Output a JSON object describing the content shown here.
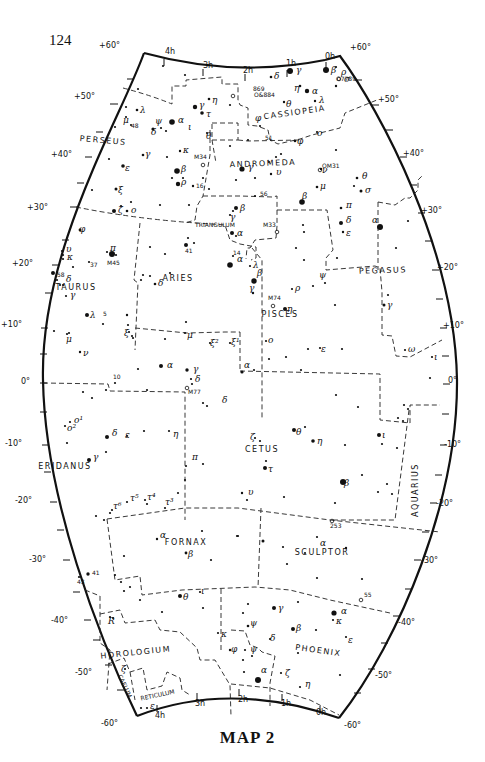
{
  "page": {
    "number": "124",
    "title": "MAP 2"
  },
  "map": {
    "border": {
      "top": "M 130 13 Q 240 50 362 55",
      "left_top_corner": [
        130,
        13
      ],
      "right_top_corner": [
        362,
        55
      ],
      "bottom_left_corner": [
        137,
        716
      ],
      "bottom_right_corner": [
        339,
        718
      ]
    },
    "declination_labels_left": [
      {
        "label": "+60°",
        "x": 120,
        "y": 48
      },
      {
        "label": "+50°",
        "x": 95,
        "y": 99
      },
      {
        "label": "+40°",
        "x": 72,
        "y": 157
      },
      {
        "label": "+30°",
        "x": 48,
        "y": 210
      },
      {
        "label": "+20°",
        "x": 33,
        "y": 266
      },
      {
        "label": "+10°",
        "x": 22,
        "y": 327
      },
      {
        "label": "0°",
        "x": 30,
        "y": 384
      },
      {
        "label": "-10°",
        "x": 22,
        "y": 446
      },
      {
        "label": "-20°",
        "x": 32,
        "y": 503
      },
      {
        "label": "-30°",
        "x": 46,
        "y": 562
      },
      {
        "label": "-40°",
        "x": 68,
        "y": 623
      },
      {
        "label": "-50°",
        "x": 92,
        "y": 675
      },
      {
        "label": "-60°",
        "x": 118,
        "y": 726
      }
    ],
    "declination_labels_right": [
      {
        "label": "+60°",
        "x": 350,
        "y": 50
      },
      {
        "label": "+50°",
        "x": 378,
        "y": 102
      },
      {
        "label": "+40°",
        "x": 403,
        "y": 156
      },
      {
        "label": "+30°",
        "x": 421,
        "y": 213
      },
      {
        "label": "+20°",
        "x": 437,
        "y": 270
      },
      {
        "label": "+10°",
        "x": 443,
        "y": 328
      },
      {
        "label": "0°",
        "x": 448,
        "y": 383
      },
      {
        "label": "-10°",
        "x": 444,
        "y": 447
      },
      {
        "label": "-20°",
        "x": 436,
        "y": 506
      },
      {
        "label": "-30°",
        "x": 421,
        "y": 563
      },
      {
        "label": "-40°",
        "x": 398,
        "y": 625
      },
      {
        "label": "-50°",
        "x": 375,
        "y": 678
      },
      {
        "label": "-60°",
        "x": 344,
        "y": 728
      }
    ],
    "ra_labels_top": [
      {
        "label": "4h",
        "x": 165,
        "y": 54
      },
      {
        "label": "3h",
        "x": 203,
        "y": 68
      },
      {
        "label": "2h",
        "x": 243,
        "y": 73
      },
      {
        "label": "1h",
        "x": 286,
        "y": 66
      },
      {
        "label": "0h",
        "x": 325,
        "y": 59
      }
    ],
    "ra_labels_bottom": [
      {
        "label": "4h",
        "x": 155,
        "y": 718
      },
      {
        "label": "3h",
        "x": 195,
        "y": 706
      },
      {
        "label": "2h",
        "x": 238,
        "y": 702
      },
      {
        "label": "1h",
        "x": 281,
        "y": 706
      },
      {
        "label": "0h",
        "x": 316,
        "y": 715
      }
    ],
    "constellations": [
      {
        "name": "CASSIOPEIA",
        "x": 295,
        "y": 115,
        "rotate": -8
      },
      {
        "name": "PERSEUS",
        "x": 103,
        "y": 143,
        "rotate": 5
      },
      {
        "name": "ANDROMEDA",
        "x": 263,
        "y": 166,
        "rotate": -2
      },
      {
        "name": "TRIANGULUM",
        "x": 215,
        "y": 227,
        "rotate": 0,
        "small": true
      },
      {
        "name": "TAURUS",
        "x": 76,
        "y": 290,
        "rotate": 0
      },
      {
        "name": "ARIES",
        "x": 178,
        "y": 281,
        "rotate": 0
      },
      {
        "name": "PISCES",
        "x": 280,
        "y": 317,
        "rotate": 0
      },
      {
        "name": "PEGASUS",
        "x": 383,
        "y": 273,
        "rotate": -2
      },
      {
        "name": "CETUS",
        "x": 262,
        "y": 452,
        "rotate": 0
      },
      {
        "name": "ERIDANUS",
        "x": 65,
        "y": 469,
        "rotate": 0
      },
      {
        "name": "AQUARIUS",
        "x": 418,
        "y": 490,
        "rotate": -90
      },
      {
        "name": "FORNAX",
        "x": 186,
        "y": 545,
        "rotate": 0
      },
      {
        "name": "SCULPTOR",
        "x": 322,
        "y": 555,
        "rotate": 0
      },
      {
        "name": "HOROLOGIUM",
        "x": 136,
        "y": 655,
        "rotate": -6
      },
      {
        "name": "PHOENIX",
        "x": 318,
        "y": 653,
        "rotate": 8
      },
      {
        "name": "RETICULUM",
        "x": 158,
        "y": 697,
        "rotate": -12,
        "small": true
      },
      {
        "name": "CAELUM",
        "x": 123,
        "y": 687,
        "rotate": 65,
        "small": true
      }
    ],
    "star_labels": [
      {
        "t": "γ",
        "x": 296,
        "y": 73
      },
      {
        "t": "β",
        "x": 331,
        "y": 73
      },
      {
        "t": "δ",
        "x": 274,
        "y": 79
      },
      {
        "t": "ρ",
        "x": 341,
        "y": 75
      },
      {
        "t": "σ",
        "x": 344,
        "y": 82
      },
      {
        "t": "η",
        "x": 294,
        "y": 91
      },
      {
        "t": "α",
        "x": 312,
        "y": 94
      },
      {
        "t": "λ",
        "x": 319,
        "y": 103
      },
      {
        "t": "θ",
        "x": 286,
        "y": 107
      },
      {
        "t": "φ",
        "x": 255,
        "y": 121
      },
      {
        "t": "ο",
        "x": 317,
        "y": 136
      },
      {
        "t": "φ",
        "x": 297,
        "y": 144
      },
      {
        "t": "η",
        "x": 212,
        "y": 103
      },
      {
        "t": "γ",
        "x": 199,
        "y": 108
      },
      {
        "t": "τ",
        "x": 206,
        "y": 117
      },
      {
        "t": "λ",
        "x": 140,
        "y": 113
      },
      {
        "t": "μ",
        "x": 123,
        "y": 123
      },
      {
        "t": "ψ",
        "x": 155,
        "y": 124
      },
      {
        "t": "α",
        "x": 178,
        "y": 123
      },
      {
        "t": "ι",
        "x": 188,
        "y": 130
      },
      {
        "t": "δ",
        "x": 151,
        "y": 135
      },
      {
        "t": "θ",
        "x": 206,
        "y": 139
      },
      {
        "t": "γ",
        "x": 145,
        "y": 157
      },
      {
        "t": "κ",
        "x": 183,
        "y": 153
      },
      {
        "t": "ε",
        "x": 125,
        "y": 171
      },
      {
        "t": "β",
        "x": 181,
        "y": 172
      },
      {
        "t": "ρ",
        "x": 181,
        "y": 185
      },
      {
        "t": "ξ",
        "x": 118,
        "y": 193
      },
      {
        "t": "ζ",
        "x": 118,
        "y": 213
      },
      {
        "t": "ο",
        "x": 131,
        "y": 213
      },
      {
        "t": "γ",
        "x": 248,
        "y": 170
      },
      {
        "t": "υ",
        "x": 276,
        "y": 175
      },
      {
        "t": "ν",
        "x": 322,
        "y": 173
      },
      {
        "t": "μ",
        "x": 320,
        "y": 189
      },
      {
        "t": "θ",
        "x": 362,
        "y": 179
      },
      {
        "t": "σ",
        "x": 365,
        "y": 193
      },
      {
        "t": "β",
        "x": 302,
        "y": 199
      },
      {
        "t": "π",
        "x": 346,
        "y": 208
      },
      {
        "t": "δ",
        "x": 346,
        "y": 223
      },
      {
        "t": "ε",
        "x": 346,
        "y": 236
      },
      {
        "t": "α",
        "x": 372,
        "y": 223
      },
      {
        "t": "β",
        "x": 240,
        "y": 211
      },
      {
        "t": "γ",
        "x": 230,
        "y": 220
      },
      {
        "t": "α",
        "x": 237,
        "y": 236
      },
      {
        "t": "φ",
        "x": 79,
        "y": 232
      },
      {
        "t": "π",
        "x": 110,
        "y": 251
      },
      {
        "t": "υ",
        "x": 66,
        "y": 252
      },
      {
        "t": "κ",
        "x": 67,
        "y": 260
      },
      {
        "t": "λ",
        "x": 253,
        "y": 268
      },
      {
        "t": "α",
        "x": 237,
        "y": 262
      },
      {
        "t": "β",
        "x": 257,
        "y": 276
      },
      {
        "t": "γ",
        "x": 249,
        "y": 291
      },
      {
        "t": "ψ",
        "x": 319,
        "y": 278
      },
      {
        "t": "ρ",
        "x": 295,
        "y": 291
      },
      {
        "t": "η",
        "x": 287,
        "y": 312
      },
      {
        "t": "δ",
        "x": 66,
        "y": 282
      },
      {
        "t": "δ",
        "x": 158,
        "y": 286
      },
      {
        "t": "γ",
        "x": 70,
        "y": 298
      },
      {
        "t": "γ",
        "x": 387,
        "y": 308
      },
      {
        "t": "λ",
        "x": 90,
        "y": 318
      },
      {
        "t": "μ",
        "x": 66,
        "y": 342
      },
      {
        "t": "ν",
        "x": 83,
        "y": 356
      },
      {
        "t": "ξ",
        "x": 124,
        "y": 336
      },
      {
        "t": "μ",
        "x": 187,
        "y": 338
      },
      {
        "t": "ξ²",
        "x": 210,
        "y": 346
      },
      {
        "t": "ξ¹",
        "x": 231,
        "y": 345
      },
      {
        "t": "ο",
        "x": 268,
        "y": 343
      },
      {
        "t": "ε",
        "x": 321,
        "y": 352
      },
      {
        "t": "ω",
        "x": 408,
        "y": 352
      },
      {
        "t": "ι",
        "x": 434,
        "y": 360
      },
      {
        "t": "α",
        "x": 167,
        "y": 368
      },
      {
        "t": "γ",
        "x": 193,
        "y": 372
      },
      {
        "t": "δ",
        "x": 195,
        "y": 382
      },
      {
        "t": "α",
        "x": 244,
        "y": 368
      },
      {
        "t": "δ",
        "x": 222,
        "y": 403
      },
      {
        "t": "ο¹",
        "x": 74,
        "y": 423
      },
      {
        "t": "ο²",
        "x": 67,
        "y": 431
      },
      {
        "t": "δ",
        "x": 112,
        "y": 436
      },
      {
        "t": "ε",
        "x": 125,
        "y": 438
      },
      {
        "t": "η",
        "x": 173,
        "y": 437
      },
      {
        "t": "γ",
        "x": 93,
        "y": 460
      },
      {
        "t": "π",
        "x": 192,
        "y": 460
      },
      {
        "t": "ζ",
        "x": 250,
        "y": 440
      },
      {
        "t": "θ",
        "x": 296,
        "y": 435
      },
      {
        "t": "η",
        "x": 317,
        "y": 444
      },
      {
        "t": "ι",
        "x": 382,
        "y": 438
      },
      {
        "t": "τ",
        "x": 268,
        "y": 472
      },
      {
        "t": "β",
        "x": 344,
        "y": 486
      },
      {
        "t": "υ",
        "x": 248,
        "y": 495
      },
      {
        "t": "τ⁶",
        "x": 113,
        "y": 509
      },
      {
        "t": "τ⁵",
        "x": 130,
        "y": 501
      },
      {
        "t": "τ⁴",
        "x": 147,
        "y": 500
      },
      {
        "t": "τ³",
        "x": 165,
        "y": 505
      },
      {
        "t": "α",
        "x": 160,
        "y": 538
      },
      {
        "t": "β",
        "x": 188,
        "y": 557
      },
      {
        "t": "α",
        "x": 320,
        "y": 546
      },
      {
        "t": "θ",
        "x": 183,
        "y": 600
      },
      {
        "t": "ι",
        "x": 201,
        "y": 594
      },
      {
        "t": "κ",
        "x": 221,
        "y": 637
      },
      {
        "t": "φ",
        "x": 231,
        "y": 652
      },
      {
        "t": "ψ",
        "x": 250,
        "y": 626
      },
      {
        "t": "ψ",
        "x": 250,
        "y": 652
      },
      {
        "t": "γ",
        "x": 278,
        "y": 611
      },
      {
        "t": "δ",
        "x": 270,
        "y": 641
      },
      {
        "t": "β",
        "x": 296,
        "y": 631
      },
      {
        "t": "α",
        "x": 341,
        "y": 614
      },
      {
        "t": "κ",
        "x": 336,
        "y": 624
      },
      {
        "t": "ε",
        "x": 348,
        "y": 643
      },
      {
        "t": "ζ",
        "x": 285,
        "y": 676
      },
      {
        "t": "η",
        "x": 305,
        "y": 687
      },
      {
        "t": "α",
        "x": 261,
        "y": 673
      },
      {
        "t": "ζ",
        "x": 121,
        "y": 672
      },
      {
        "t": "R",
        "x": 108,
        "y": 624
      },
      {
        "t": "ε",
        "x": 150,
        "y": 709
      }
    ],
    "number_labels": [
      {
        "t": "48",
        "x": 131,
        "y": 128
      },
      {
        "t": "51",
        "x": 265,
        "y": 140
      },
      {
        "t": "16",
        "x": 196,
        "y": 188
      },
      {
        "t": "56",
        "x": 260,
        "y": 196
      },
      {
        "t": "41",
        "x": 185,
        "y": 253
      },
      {
        "t": "37",
        "x": 90,
        "y": 267
      },
      {
        "t": "58",
        "x": 57,
        "y": 277
      },
      {
        "t": "14",
        "x": 233,
        "y": 255
      },
      {
        "t": "5",
        "x": 103,
        "y": 316
      },
      {
        "t": "10",
        "x": 113,
        "y": 379
      },
      {
        "t": "41",
        "x": 92,
        "y": 575
      },
      {
        "t": "43",
        "x": 77,
        "y": 584
      },
      {
        "t": "55",
        "x": 364,
        "y": 597
      },
      {
        "t": "253",
        "x": 330,
        "y": 528
      }
    ],
    "deep_sky_objects": [
      {
        "t": "869",
        "x": 253,
        "y": 91
      },
      {
        "t": "O&884",
        "x": 254,
        "y": 97
      },
      {
        "t": "O7789",
        "x": 336,
        "y": 81
      },
      {
        "t": "M34",
        "x": 194,
        "y": 159
      },
      {
        "t": "OM31",
        "x": 322,
        "y": 168
      },
      {
        "t": "M33",
        "x": 263,
        "y": 227
      },
      {
        "t": "M45",
        "x": 107,
        "y": 265
      },
      {
        "t": "M74",
        "x": 268,
        "y": 300
      },
      {
        "t": "M77",
        "x": 188,
        "y": 394
      }
    ]
  }
}
